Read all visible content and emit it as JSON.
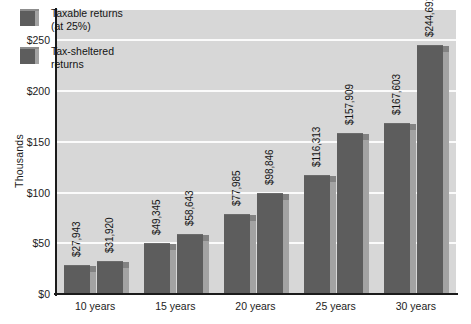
{
  "chart_data": {
    "type": "bar",
    "title": "",
    "subtitle": "",
    "xlabel": "",
    "ylabel": "Thousands",
    "categories": [
      "10 years",
      "15 years",
      "20 years",
      "25 years",
      "30 years"
    ],
    "series": [
      {
        "name": "Taxable returns (at 25%)",
        "legend_line1": "Taxable returns",
        "legend_line2": "(at 25%)",
        "values": [
          27943,
          49345,
          77985,
          116313,
          167603
        ],
        "labels": [
          "$27,943",
          "$49,345",
          "$77,985",
          "$116,313",
          "$167,603"
        ],
        "color": "#5d5d5d"
      },
      {
        "name": "Tax-sheltered returns",
        "legend_line1": "Tax-sheltered",
        "legend_line2": "returns",
        "values": [
          31920,
          58643,
          98846,
          157909,
          244691
        ],
        "labels": [
          "$31,920",
          "$58,643",
          "$98,846",
          "$157,909",
          "$244,691"
        ],
        "color": "#5d5d5d"
      }
    ],
    "ylim": [
      0,
      280
    ],
    "yticks": [
      0,
      50000,
      100000,
      150000,
      200000,
      250000
    ],
    "ytick_labels": [
      "$0",
      "$50",
      "$100",
      "$150",
      "$200",
      "$250"
    ],
    "y_units": "thousands",
    "grid": true,
    "grid_color": "#fbfbfb",
    "legend_position": "top-left-inside",
    "plot_background": "#d7d7d7",
    "axis_color": "#1b1b1b",
    "bar_side_color": "#a3a3a3",
    "bar_top_color": "#828282",
    "data_label_rotation": -90
  }
}
